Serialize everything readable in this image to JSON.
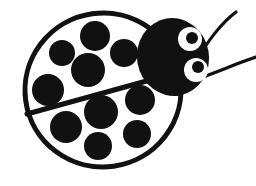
{
  "image": {
    "title": "Ladybug",
    "subject": "ladybug",
    "style": "black and white clipart line art",
    "background_color": "#FFFFFF",
    "ink_color": "#111111",
    "width": 256,
    "height": 186
  },
  "palette": {
    "black": "#111111",
    "white": "#FFFFFF"
  },
  "body": {
    "label": "ladybug body",
    "shape": "ellipse",
    "center_x": 103,
    "center_y": 90,
    "radius_x": 78,
    "radius_y": 77,
    "rotation_deg": -8,
    "fill": "#FFFFFF",
    "stroke": "#111111",
    "stroke_width": 5
  },
  "wing_divider": {
    "label": "wing division line",
    "x1": 27,
    "y1": 114,
    "x2": 172,
    "y2": 74,
    "stroke": "#111111",
    "stroke_width": 5
  },
  "spots": {
    "total_count": 10,
    "fill": "#111111",
    "upper_wing": [
      {
        "cx": 95,
        "cy": 36,
        "r": 15
      },
      {
        "cx": 62,
        "cy": 53,
        "r": 13
      },
      {
        "cx": 124,
        "cy": 53,
        "r": 14
      },
      {
        "cx": 88,
        "cy": 70,
        "r": 17
      },
      {
        "cx": 48,
        "cy": 90,
        "r": 16
      }
    ],
    "lower_wing": [
      {
        "cx": 101,
        "cy": 112,
        "r": 17
      },
      {
        "cx": 140,
        "cy": 100,
        "r": 15
      },
      {
        "cx": 66,
        "cy": 127,
        "r": 16
      },
      {
        "cx": 137,
        "cy": 134,
        "r": 14
      },
      {
        "cx": 98,
        "cy": 146,
        "r": 14
      }
    ]
  },
  "head": {
    "label": "ladybug head",
    "cx": 173,
    "cy": 57,
    "rx": 36,
    "ry": 39,
    "rotation_deg": -10,
    "fill": "#111111"
  },
  "eyes": [
    {
      "name": "upper-eye",
      "cx": 190,
      "cy": 39,
      "r": 12,
      "sclera": "#FFFFFF",
      "pupil": {
        "cx": 192,
        "cy": 38,
        "r": 6,
        "fill": "#111111"
      }
    },
    {
      "name": "lower-eye",
      "cx": 196,
      "cy": 70,
      "r": 12,
      "sclera": "#FFFFFF",
      "pupil": {
        "cx": 198,
        "cy": 67,
        "r": 6,
        "fill": "#111111"
      }
    }
  ],
  "antennae": [
    {
      "name": "upper-antenna",
      "path": "M 198 57 C 208 42, 220 24, 236 12",
      "stroke": "#111111",
      "stroke_width": 3.2
    },
    {
      "name": "lower-antenna",
      "path": "M 196 79 C 214 74, 234 64, 256 57",
      "stroke": "#111111",
      "stroke_width": 3.2
    }
  ],
  "caption": {
    "alt_text": "Black and white ladybug clipart with ten spots, round head and two antennae"
  }
}
